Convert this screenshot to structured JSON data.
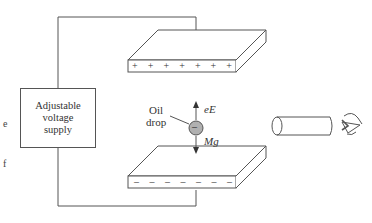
{
  "diagram": {
    "supply": {
      "lines": [
        "Adjustable",
        "voltage",
        "supply"
      ]
    },
    "top_plate": {
      "charge_symbols": [
        "+",
        "+",
        "+",
        "+",
        "+",
        "+",
        "+"
      ]
    },
    "bottom_plate": {
      "charge_symbols": [
        "–",
        "–",
        "–",
        "–",
        "–",
        "–",
        "–"
      ]
    },
    "drop": {
      "label_line1": "Oil",
      "label_line2": "drop",
      "charge_symbol": "–"
    },
    "forces": {
      "up": "eE",
      "down": "Mg"
    },
    "viewer": {
      "microscope": "telescope-tube",
      "eye": "eye-icon"
    },
    "edge_fragments": [
      "e",
      "f"
    ],
    "colors": {
      "line": "#555555",
      "drop_fill": "#b0b0b0",
      "background": "#ffffff"
    }
  }
}
